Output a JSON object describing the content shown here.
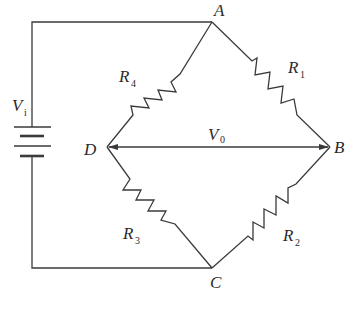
{
  "diagram": {
    "type": "wheatstone-bridge-circuit",
    "background": "#ffffff",
    "line_color": "#3a3a3a",
    "nodes": {
      "A": {
        "label": "A"
      },
      "B": {
        "label": "B"
      },
      "C": {
        "label": "C"
      },
      "D": {
        "label": "D"
      }
    },
    "resistors": [
      {
        "id": "R1",
        "symbol": "R",
        "sub": "1",
        "between": [
          "A",
          "B"
        ]
      },
      {
        "id": "R2",
        "symbol": "R",
        "sub": "2",
        "between": [
          "B",
          "C"
        ]
      },
      {
        "id": "R3",
        "symbol": "R",
        "sub": "3",
        "between": [
          "C",
          "D"
        ]
      },
      {
        "id": "R4",
        "symbol": "R",
        "sub": "4",
        "between": [
          "D",
          "A"
        ]
      }
    ],
    "source": {
      "symbol": "V",
      "sub": "i",
      "connects": [
        "A",
        "C"
      ]
    },
    "output": {
      "symbol": "V",
      "sub": "0",
      "between": [
        "D",
        "B"
      ],
      "style": "double-headed-arrow"
    }
  }
}
